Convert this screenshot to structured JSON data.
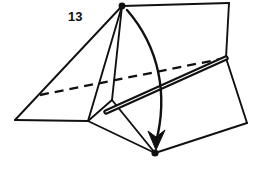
{
  "figure": {
    "background_color": "#ffffff",
    "ink_color": "#111111",
    "width": 262,
    "height": 172,
    "labels": [
      {
        "id": "label-13",
        "text": "13",
        "x": 68,
        "y": 21
      }
    ],
    "vertices": {
      "apex": {
        "name": "apex-point",
        "x": 122,
        "y": 6
      },
      "top_right": {
        "name": "top-right-corner",
        "x": 229,
        "y": 3
      },
      "hinge": {
        "name": "hinge-vertex",
        "x": 226,
        "y": 58
      },
      "left": {
        "name": "left-corner",
        "x": 15,
        "y": 120
      },
      "junction": {
        "name": "base-junction",
        "x": 88,
        "y": 121
      },
      "dash_start": {
        "name": "dashed-edge-start",
        "x": 40,
        "y": 95
      },
      "crease_left": {
        "name": "crease-left-end",
        "x": 106,
        "y": 112
      },
      "bottom_dot": {
        "name": "bottom-point",
        "x": 155,
        "y": 153
      },
      "flap_right": {
        "name": "flap-right-corner",
        "x": 247,
        "y": 123
      },
      "flap_mid": {
        "name": "flap-mid-corner",
        "x": 112,
        "y": 100
      }
    },
    "solid_edges": [
      {
        "name": "edge-apex-to-topright",
        "d": "M 122 6 L 229 3"
      },
      {
        "name": "edge-topright-to-hinge",
        "d": "M 229 3 L 226 58"
      },
      {
        "name": "edge-apex-to-left",
        "d": "M 122 6 L 15 120"
      },
      {
        "name": "edge-apex-to-junction",
        "d": "M 122 6 L 88 121"
      },
      {
        "name": "edge-apex-to-flapmid",
        "d": "M 122 6 L 112 100"
      },
      {
        "name": "edge-left-to-junction",
        "d": "M 15 120 L 88 121"
      },
      {
        "name": "edge-junction-to-flapmid",
        "d": "M 88 121 L 112 100"
      },
      {
        "name": "edge-junction-to-bottomdot",
        "d": "M 88 121 L 155 153"
      },
      {
        "name": "edge-flapmid-to-bottomdot",
        "d": "M 112 100 L 155 153"
      },
      {
        "name": "edge-bottomdot-to-flapright",
        "d": "M 155 153 L 247 123"
      },
      {
        "name": "edge-hinge-to-flapright",
        "d": "M 226 58 L 247 123"
      }
    ],
    "dashed_edges": [
      {
        "name": "hidden-edge-dashed",
        "d": "M 40 95 L 226 58"
      }
    ],
    "crease_edges": [
      {
        "name": "fold-crease-double-line",
        "d": "M 106 112 L 226 58"
      }
    ],
    "arrow": {
      "name": "fold-direction-arrow",
      "path": "M 127 10 C 160 48 168 96 156 142",
      "head": "M 156 150 L 148 131 L 156 137 L 165 130 Z"
    },
    "dots": [
      {
        "name": "apex-dot",
        "x": 122,
        "y": 6,
        "r": 3.4
      },
      {
        "name": "bottom-dot",
        "x": 155,
        "y": 153,
        "r": 3.6
      }
    ]
  }
}
